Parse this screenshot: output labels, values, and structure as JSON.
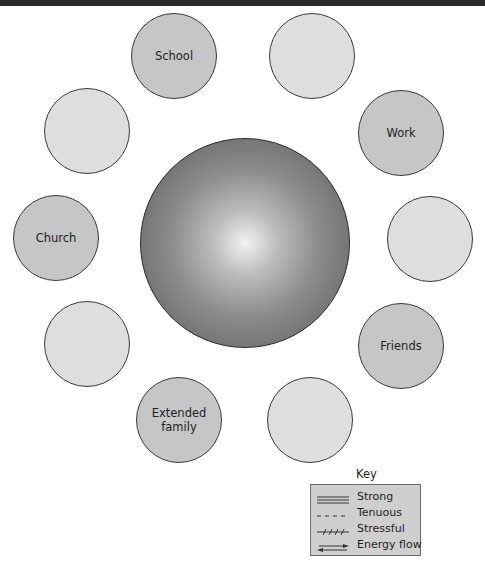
{
  "diagram": {
    "type": "ecomap",
    "center": {
      "label": "",
      "cx": 245,
      "cy": 243,
      "r": 105
    },
    "nodes": [
      {
        "id": "school",
        "label": "School",
        "cx": 174,
        "cy": 56,
        "r": 43,
        "filled": true
      },
      {
        "id": "top-right-empty",
        "label": "",
        "cx": 312,
        "cy": 56,
        "r": 43,
        "filled": false
      },
      {
        "id": "upper-left-empty",
        "label": "",
        "cx": 87,
        "cy": 131,
        "r": 43,
        "filled": false
      },
      {
        "id": "work",
        "label": "Work",
        "cx": 401,
        "cy": 133,
        "r": 43,
        "filled": true
      },
      {
        "id": "church",
        "label": "Church",
        "cx": 56,
        "cy": 238,
        "r": 43,
        "filled": true
      },
      {
        "id": "right-empty",
        "label": "",
        "cx": 430,
        "cy": 239,
        "r": 43,
        "filled": false
      },
      {
        "id": "lower-left-empty",
        "label": "",
        "cx": 87,
        "cy": 344,
        "r": 43,
        "filled": false
      },
      {
        "id": "friends",
        "label": "Friends",
        "cx": 401,
        "cy": 346,
        "r": 43,
        "filled": true
      },
      {
        "id": "extended-family",
        "label": "Extended family",
        "cx": 179,
        "cy": 420,
        "r": 43,
        "filled": true
      },
      {
        "id": "bottom-right-empty",
        "label": "",
        "cx": 310,
        "cy": 420,
        "r": 43,
        "filled": false
      }
    ],
    "key": {
      "title": "Key",
      "items": [
        {
          "style": "strong",
          "label": "Strong"
        },
        {
          "style": "tenuous",
          "label": "Tenuous"
        },
        {
          "style": "stressful",
          "label": "Stressful"
        },
        {
          "style": "energy-flow",
          "label": "Energy flow"
        }
      ]
    },
    "colors": {
      "labeled_node": "#c6c6c6",
      "empty_node": "#dedede",
      "outline": "#3a3a3a",
      "key_bg": "#cfcfcf"
    }
  }
}
